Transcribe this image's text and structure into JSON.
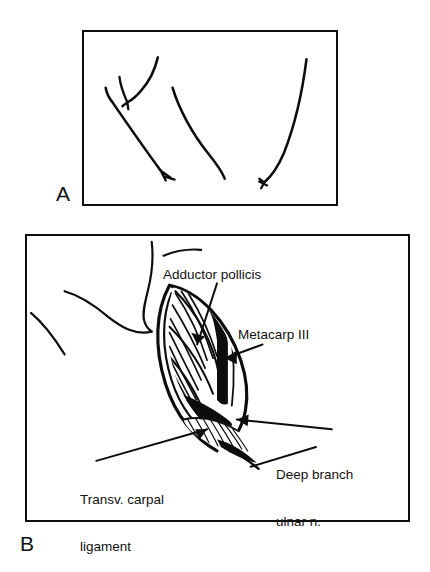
{
  "figure": {
    "type": "medical-surgical-illustration",
    "background_color": "#ffffff",
    "ink_color": "#0d0d0d"
  },
  "panels": [
    {
      "id": "a",
      "letter": "A",
      "caption": "",
      "description": "Line drawing of hand surface contours showing planned incision"
    },
    {
      "id": "b",
      "letter": "B",
      "caption": "",
      "description": "Opened surgical exposure with labeled anatomic structures"
    }
  ],
  "annotations": [
    {
      "id": "adductor-pollicis",
      "text": "Adductor pollicis",
      "lines": [
        "Adductor pollicis"
      ]
    },
    {
      "id": "metacarp-iii",
      "text": "Metacarp III",
      "lines": [
        "Metacarp III"
      ]
    },
    {
      "id": "deep-branch-ulnar",
      "text": "Deep branch ulnar n.",
      "lines": [
        "Deep branch",
        "ulnar n."
      ]
    },
    {
      "id": "transv-carpal-ligament",
      "text": "Transv. carpal ligament",
      "lines": [
        "Transv. carpal",
        "ligament"
      ]
    }
  ]
}
